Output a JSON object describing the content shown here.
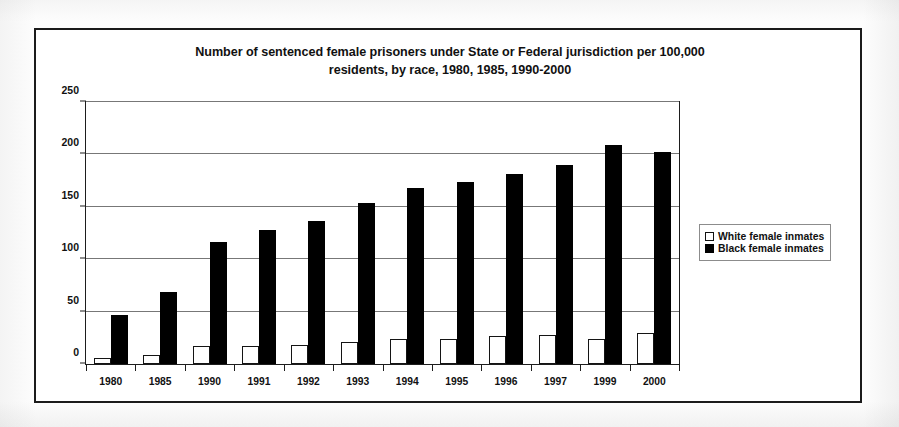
{
  "chart_data": {
    "type": "bar",
    "title": "Number of sentenced female prisoners under State or Federal jurisdiction per 100,000 residents, by race, 1980, 1985, 1990-2000",
    "title_line1": "Number of sentenced female prisoners under State or Federal jurisdiction per 100,000",
    "title_line2": "residents, by race, 1980, 1985, 1990-2000",
    "xlabel": "",
    "ylabel": "",
    "ylim": [
      0,
      250
    ],
    "yticks": [
      0,
      50,
      100,
      150,
      200,
      250
    ],
    "ytick_labels": [
      "0",
      "50",
      "100",
      "150",
      "200",
      "250"
    ],
    "grid": true,
    "legend_position": "right",
    "categories": [
      "1980",
      "1985",
      "1990",
      "1991",
      "1992",
      "1993",
      "1994",
      "1995",
      "1996",
      "1997",
      "1999",
      "2000"
    ],
    "series": [
      {
        "name": "White female inmates",
        "color": "#ffffff",
        "edge_color": "#141414",
        "values": [
          6,
          9,
          17,
          17,
          18,
          21,
          24,
          24,
          27,
          28,
          24,
          30
        ]
      },
      {
        "name": "Black female inmates",
        "color": "#000000",
        "edge_color": "#000000",
        "values": [
          47,
          69,
          116,
          128,
          136,
          154,
          168,
          174,
          181,
          190,
          209,
          202
        ]
      }
    ]
  },
  "legend": {
    "entries": [
      {
        "label": "White female inmates",
        "swatch": "white-square-icon"
      },
      {
        "label": "Black female inmates",
        "swatch": "black-square-icon"
      }
    ]
  },
  "colors": {
    "frame": "#1b1b1b",
    "axis": "#1d1d1d",
    "gridline": "#777777",
    "text": "#111111",
    "page_background": "#fdfdfd",
    "plot_background": "#ffffff"
  }
}
